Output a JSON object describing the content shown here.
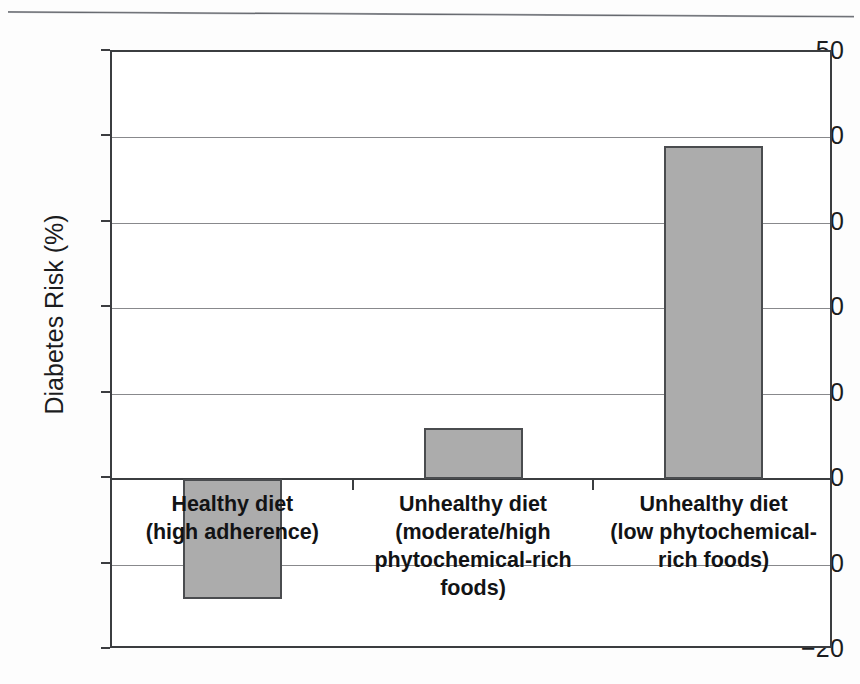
{
  "figure": {
    "background_color": "#fdfdfd",
    "page_rule": "horizontal-rule"
  },
  "chart_data": {
    "type": "bar",
    "title": "",
    "subtitle": "",
    "xlabel": "",
    "ylabel": "Diabetes Risk (%)",
    "categories": [
      "Healthy diet\n(high adherence)",
      "Unhealthy diet\n(moderate/high\nphytochemical-rich\nfoods)",
      "Unhealthy diet\n(low phytochemical-\nrich foods)"
    ],
    "values": [
      -14,
      6,
      39
    ],
    "ylim": [
      -20,
      50
    ],
    "yticks": [
      50,
      40,
      30,
      20,
      10,
      0,
      -10,
      -20
    ],
    "ytick_labels": [
      "50",
      "40",
      "30",
      "20",
      "10",
      "0",
      "−10",
      "−20"
    ],
    "grid": true,
    "grid_axis": "y",
    "legend": false,
    "legend_position": "none",
    "bar_fill_color": "#acacac",
    "bar_edge_color": "#4a4c4f",
    "gridline_color": "#88898c",
    "axis_color": "#3b3d40",
    "plot_background": "#ffffff",
    "bar_labels_inside_plot": true
  }
}
